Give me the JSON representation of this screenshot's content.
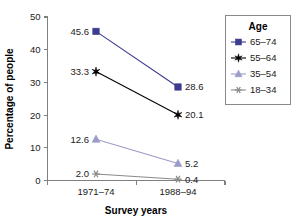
{
  "chart_data": {
    "type": "line",
    "title": "",
    "xlabel": "Survey years",
    "ylabel": "Percentage of people",
    "categories": [
      "1971–74",
      "1988–94"
    ],
    "ylim": [
      0,
      50
    ],
    "yticks": [
      0,
      10,
      20,
      30,
      40,
      50
    ],
    "ytick_labels": [
      "0",
      "10",
      "20",
      "30",
      "40",
      "50"
    ],
    "grid": false,
    "legend_position": "top-right",
    "legend_title": "Age",
    "series": [
      {
        "name": "65–74",
        "values": [
          45.6,
          28.6
        ],
        "labels": [
          "45.6",
          "28.6"
        ],
        "color": "#3b3b8f",
        "marker": "square"
      },
      {
        "name": "55–64",
        "values": [
          33.3,
          20.1
        ],
        "labels": [
          "33.3",
          "20.1"
        ],
        "color": "#000000",
        "marker": "star"
      },
      {
        "name": "35–54",
        "values": [
          12.6,
          5.2
        ],
        "labels": [
          "12.6",
          "5.2"
        ],
        "color": "#9b9bc8",
        "marker": "triangle"
      },
      {
        "name": "18–34",
        "values": [
          2.0,
          0.4
        ],
        "labels": [
          "2.0",
          "0.4"
        ],
        "color": "#8a8a8a",
        "marker": "asterisk"
      }
    ]
  },
  "axes": {
    "y_title": "Percentage of people",
    "x_title": "Survey years"
  },
  "legend": {
    "title": "Age",
    "items": [
      {
        "label": "65–74"
      },
      {
        "label": "55–64"
      },
      {
        "label": "35–54"
      },
      {
        "label": "18–34"
      }
    ]
  }
}
